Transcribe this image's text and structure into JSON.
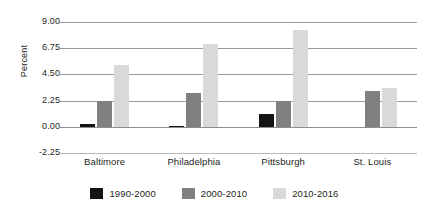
{
  "chart_data": {
    "type": "bar",
    "title": "",
    "xlabel": "",
    "ylabel": "Percent",
    "ylim": [
      -2.25,
      9.0
    ],
    "yticks": [
      "9.00",
      "6.75",
      "4.50",
      "2.25",
      "0.00",
      "-2.25"
    ],
    "ytick_values": [
      9.0,
      6.75,
      4.5,
      2.25,
      0.0,
      -2.25
    ],
    "grid": true,
    "legend_position": "bottom",
    "categories": [
      "Baltimore",
      "Philadelphia",
      "Pittsburgh",
      "St. Louis"
    ],
    "series": [
      {
        "name": "1990-2000",
        "color": "#141414",
        "values": [
          0.26,
          0.04,
          1.12,
          0.0
        ]
      },
      {
        "name": "2000-2010",
        "color": "#808080",
        "values": [
          2.2,
          2.9,
          2.22,
          3.1
        ]
      },
      {
        "name": "2010-2016",
        "color": "#d9d9d9",
        "values": [
          5.3,
          7.08,
          8.3,
          3.35
        ]
      }
    ]
  },
  "axis": {
    "y_title": "Percent",
    "ticks": [
      {
        "label": "9.00"
      },
      {
        "label": "6.75"
      },
      {
        "label": "4.50"
      },
      {
        "label": "2.25"
      },
      {
        "label": "0.00"
      },
      {
        "label": "-2.25"
      }
    ]
  },
  "categories": [
    {
      "label": "Baltimore"
    },
    {
      "label": "Philadelphia"
    },
    {
      "label": "Pittsburgh"
    },
    {
      "label": "St. Louis"
    }
  ],
  "legend": [
    {
      "label": "1990-2000"
    },
    {
      "label": "2000-2010"
    },
    {
      "label": "2010-2016"
    }
  ]
}
